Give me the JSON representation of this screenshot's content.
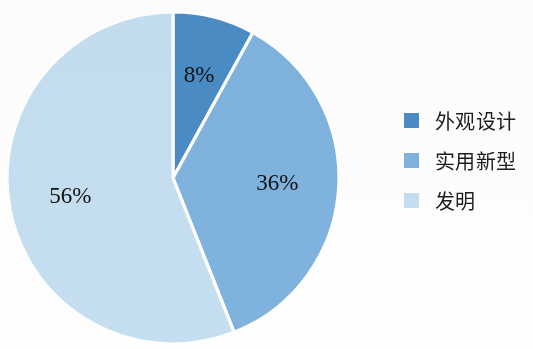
{
  "chart_data": {
    "type": "pie",
    "title": "",
    "categories": [
      "外观设计",
      "实用新型",
      "发明"
    ],
    "values": [
      8,
      36,
      56
    ],
    "value_labels": [
      "8%",
      "36%",
      "56%"
    ],
    "colors": [
      "#4a8cc4",
      "#7fb3dd",
      "#c5dff0"
    ],
    "unit": "%",
    "start_angle_deg": 0,
    "direction": "clockwise",
    "legend_position": "right",
    "grid": false,
    "background_color": "#fefefe",
    "separator_color": "#ffffff",
    "label_color": "#121212",
    "slices": [
      {
        "label": "外观设计",
        "value": 8,
        "display": "8%",
        "color": "#4a8cc4"
      },
      {
        "label": "实用新型",
        "value": 36,
        "display": "36%",
        "color": "#7fb3dd"
      },
      {
        "label": "发明",
        "value": 56,
        "display": "56%",
        "color": "#c5dff0"
      }
    ]
  },
  "legend": {
    "items": [
      {
        "label": "外观设计",
        "color": "#4a8cc4"
      },
      {
        "label": "实用新型",
        "color": "#7fb3dd"
      },
      {
        "label": "发明",
        "color": "#c5dff0"
      }
    ]
  }
}
